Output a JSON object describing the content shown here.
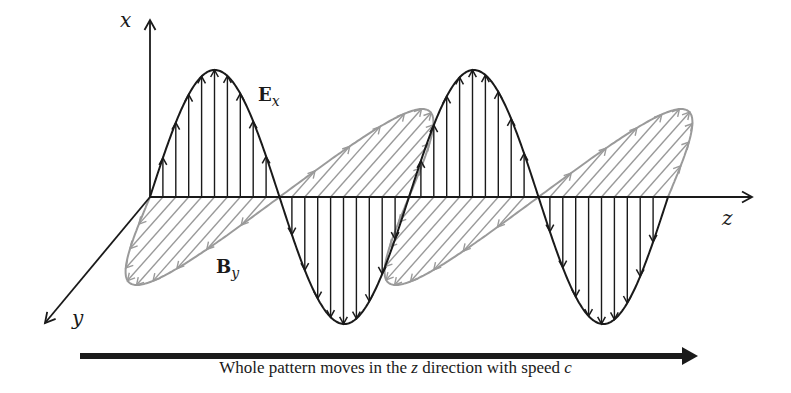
{
  "figure": {
    "axes": {
      "x_label": "x",
      "y_label": "y",
      "z_label": "z"
    },
    "fields": {
      "electric": {
        "symbol": "E",
        "subscript": "x",
        "color": "#1a1a1a"
      },
      "magnetic": {
        "symbol": "B",
        "subscript": "y",
        "color": "#9a9a9a"
      }
    },
    "caption": {
      "before": "Whole pattern moves in the ",
      "z": "z",
      "middle": " direction with speed ",
      "c": "c"
    },
    "geometry": {
      "origin": [
        150,
        197
      ],
      "z_axis_end": 752,
      "x_axis_top": 20,
      "y_axis_end": [
        45,
        323
      ],
      "wavelength": 259,
      "wave_end": 668,
      "e_amplitude": 127,
      "b_vector": [
        -78,
        88
      ],
      "e_arrow_spacing": 12.9,
      "b_arrow_spacing": 12.9,
      "motion_arrow": {
        "x1": 80,
        "x2": 698,
        "y": 356
      }
    }
  }
}
